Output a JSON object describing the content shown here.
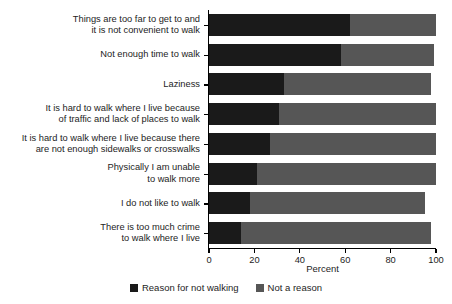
{
  "chart_data": {
    "type": "bar",
    "orientation": "horizontal",
    "stacked": true,
    "title": "",
    "xlabel": "Percent",
    "ylabel": "",
    "xlim": [
      0,
      100
    ],
    "xticks": [
      0,
      20,
      40,
      60,
      80,
      100
    ],
    "xticklabels": [
      "0",
      "20",
      "40",
      "60",
      "80",
      "100"
    ],
    "grid": false,
    "legend_position": "bottom",
    "categories": [
      "Things are too far to get to and\nit is not convenient to walk",
      "Not enough time to walk",
      "Laziness",
      "It is hard to walk where I live because\nof traffic and lack of places to walk",
      "It is hard to walk where I live because there\nare not enough sidewalks or crosswalks",
      "Physically I am unable\nto walk more",
      "I do not like to walk",
      "There is too much crime\nto walk where I live"
    ],
    "series": [
      {
        "name": "Reason for not walking",
        "color": "#1a1a1a",
        "values": [
          62,
          58,
          33,
          31,
          27,
          21,
          18,
          14
        ]
      },
      {
        "name": "Not a reason",
        "color": "#565656",
        "values": [
          38,
          41,
          65,
          69,
          73,
          79,
          77,
          84
        ]
      }
    ],
    "totals": [
      100,
      99,
      98,
      100,
      100,
      100,
      95,
      98
    ]
  },
  "legend": {
    "items": [
      {
        "label": "Reason for not walking",
        "swatch": "black-square"
      },
      {
        "label": "Not a reason",
        "swatch": "gray-square"
      }
    ]
  }
}
